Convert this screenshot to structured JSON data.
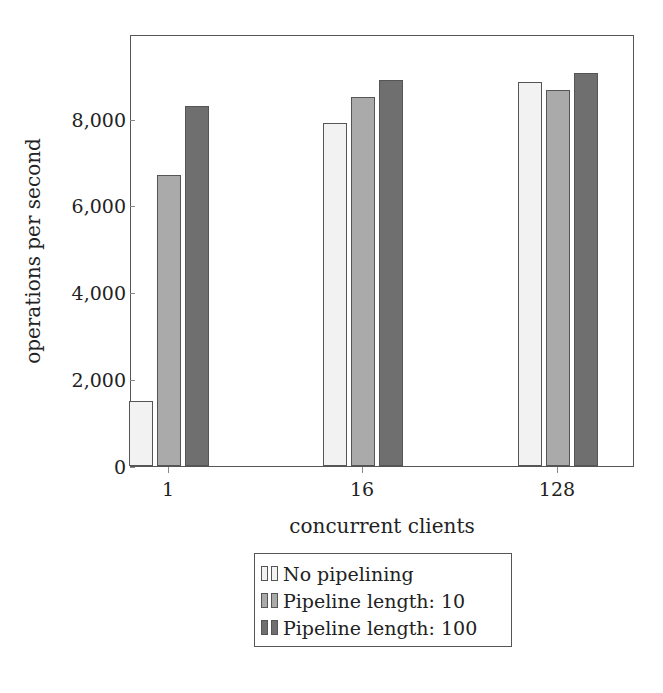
{
  "chart_data": {
    "type": "bar",
    "title": "",
    "xlabel": "concurrent clients",
    "ylabel": "operations per second",
    "categories": [
      "1",
      "16",
      "128"
    ],
    "series": [
      {
        "name": "No pipelining",
        "values": [
          1500,
          7900,
          8850
        ],
        "color": "#f2f2f2"
      },
      {
        "name": "Pipeline length: 10",
        "values": [
          6700,
          8500,
          8650
        ],
        "color": "#aaaaaa"
      },
      {
        "name": "Pipeline length: 100",
        "values": [
          8300,
          8900,
          9050
        ],
        "color": "#6f6f6f"
      }
    ],
    "ylim": [
      0,
      9950
    ],
    "yticks": [
      0,
      2000,
      4000,
      6000,
      8000
    ],
    "ytick_labels": [
      "0",
      "2,000",
      "4,000",
      "6,000",
      "8,000"
    ],
    "grid": false,
    "legend_position": "below"
  }
}
